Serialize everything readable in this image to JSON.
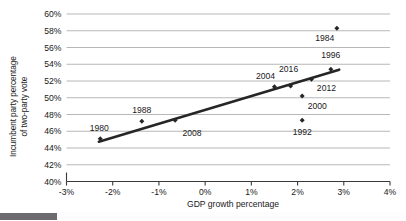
{
  "chart_data": {
    "type": "scatter",
    "title": "",
    "xlabel": "GDP growth percentage",
    "ylabel_line1": "Incumbent party percentage",
    "ylabel_line2": "of two-party vote",
    "xlim": [
      -3,
      4
    ],
    "ylim": [
      40,
      60
    ],
    "xticks": [
      "-3%",
      "-2%",
      "-1%",
      "0%",
      "1%",
      "2%",
      "3%",
      "4%"
    ],
    "xtick_values": [
      -3,
      -2,
      -1,
      0,
      1,
      2,
      3,
      4
    ],
    "yticks": [
      "40%",
      "42%",
      "44%",
      "46%",
      "48%",
      "50%",
      "52%",
      "54%",
      "56%",
      "58%",
      "60%"
    ],
    "ytick_values": [
      40,
      42,
      44,
      46,
      48,
      50,
      52,
      54,
      56,
      58,
      60
    ],
    "grid": "horizontal",
    "legend": "none",
    "marker_color": "#262626",
    "trendline_color": "#262626",
    "gridline_color": "#9a9a9a",
    "points": [
      {
        "label": "1980",
        "x": -2.27,
        "y": 45.1,
        "label_dx": -1,
        "label_dy": -8
      },
      {
        "label": "1988",
        "x": -1.37,
        "y": 47.2,
        "label_dx": 0,
        "label_dy": -8
      },
      {
        "label": "2008",
        "x": -0.65,
        "y": 47.3,
        "label_dx": 17,
        "label_dy": 16
      },
      {
        "label": "2004",
        "x": 1.5,
        "y": 51.3,
        "label_dx": -9,
        "label_dy": -8
      },
      {
        "label": "2016",
        "x": 1.85,
        "y": 51.4,
        "label_dx": -2,
        "label_dy": -14
      },
      {
        "label": "2012",
        "x": 2.3,
        "y": 52.2,
        "label_dx": 15,
        "label_dy": 12
      },
      {
        "label": "2000",
        "x": 2.1,
        "y": 50.2,
        "label_dx": 15,
        "label_dy": 13
      },
      {
        "label": "1992",
        "x": 2.1,
        "y": 47.3,
        "label_dx": 0,
        "label_dy": 15
      },
      {
        "label": "1996",
        "x": 2.72,
        "y": 53.4,
        "label_dx": 0,
        "label_dy": -11
      },
      {
        "label": "1984",
        "x": 2.85,
        "y": 58.3,
        "label_dx": -12,
        "label_dy": 13
      }
    ],
    "trendline": {
      "x1": -2.3,
      "y1": 44.75,
      "x2": 2.9,
      "y2": 53.35
    }
  },
  "scrollbar": {
    "name": "horizontal-scrollbar"
  }
}
